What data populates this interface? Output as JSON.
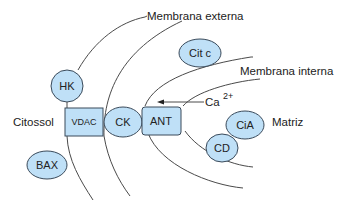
{
  "diagram": {
    "labels": {
      "outer_membrane": "Membrana externa",
      "inner_membrane": "Membrana interna",
      "cytosol": "Citossol",
      "matrix": "Matriz",
      "calcium": "Ca",
      "calcium_charge": "2+"
    },
    "nodes": {
      "hk": "HK",
      "vdac": "VDAC",
      "ck": "CK",
      "ant": "ANT",
      "cit_c": "Cit c",
      "bax": "BAX",
      "cia": "CiA",
      "cd": "CD"
    },
    "colors": {
      "node_fill": "#bfe0f7",
      "node_stroke": "#3a4a5a",
      "line": "#4a4a4a",
      "text": "#222222"
    }
  }
}
